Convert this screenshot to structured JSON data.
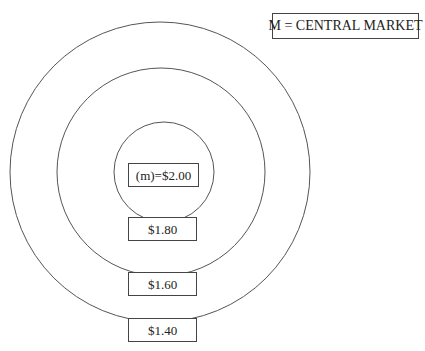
{
  "legend": {
    "text": "M = CENTRAL MARKET"
  },
  "rings": [
    {
      "id": "outer",
      "cx": 160,
      "cy": 172,
      "r": 150
    },
    {
      "id": "middle",
      "cx": 161,
      "cy": 172,
      "r": 104
    },
    {
      "id": "inner",
      "cx": 164,
      "cy": 172,
      "r": 50
    }
  ],
  "labels": {
    "center": "(m)=$2.00",
    "ring_inner": "$1.80",
    "ring_middle": "$1.60",
    "ring_outer": "$1.40"
  },
  "colors": {
    "line": "#555555",
    "box_border": "#444444",
    "text": "#222222",
    "background": "#ffffff"
  }
}
